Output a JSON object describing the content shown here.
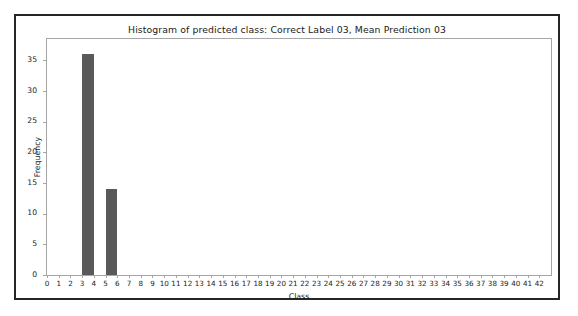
{
  "chart_data": {
    "type": "bar",
    "title": "Histogram of predicted class: Correct Label 03, Mean Prediction 03",
    "xlabel": "Class",
    "ylabel": "Frequency",
    "categories": [
      0,
      1,
      2,
      3,
      4,
      5,
      6,
      7,
      8,
      9,
      10,
      11,
      12,
      13,
      14,
      15,
      16,
      17,
      18,
      19,
      20,
      21,
      22,
      23,
      24,
      25,
      26,
      27,
      28,
      29,
      30,
      31,
      32,
      33,
      34,
      35,
      36,
      37,
      38,
      39,
      40,
      41,
      42
    ],
    "values": [
      0,
      0,
      0,
      36,
      0,
      14,
      0,
      0,
      0,
      0,
      0,
      0,
      0,
      0,
      0,
      0,
      0,
      0,
      0,
      0,
      0,
      0,
      0,
      0,
      0,
      0,
      0,
      0,
      0,
      0,
      0,
      0,
      0,
      0,
      0,
      0,
      0,
      0,
      0,
      0,
      0,
      0,
      0
    ],
    "bars": [
      {
        "class": 3,
        "frequency": 36,
        "left_edge": 3,
        "right_edge": 4
      },
      {
        "class": 5,
        "frequency": 14,
        "left_edge": 5,
        "right_edge": 6
      }
    ],
    "xlim": [
      0,
      43
    ],
    "ylim": [
      0,
      38.5
    ],
    "xticks": [
      0,
      1,
      2,
      3,
      4,
      5,
      6,
      7,
      8,
      9,
      10,
      11,
      12,
      13,
      14,
      15,
      16,
      17,
      18,
      19,
      20,
      21,
      22,
      23,
      24,
      25,
      26,
      27,
      28,
      29,
      30,
      31,
      32,
      33,
      34,
      35,
      36,
      37,
      38,
      39,
      40,
      41,
      42
    ],
    "yticks": [
      0,
      5,
      10,
      15,
      20,
      25,
      30,
      35
    ],
    "grid": false,
    "legend": null,
    "bar_color": "#595959",
    "axes_color": "#a6a6a6",
    "figure_border_color": "#262626",
    "background_color": "#ffffff"
  }
}
